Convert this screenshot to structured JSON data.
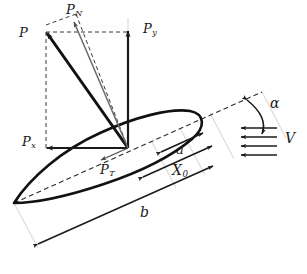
{
  "figure": {
    "type": "airfoil-force-diagram"
  },
  "labels": {
    "resultant_force": {
      "base": "P",
      "sub": "",
      "x": 19,
      "y": 26
    },
    "normal_force": {
      "base": "P",
      "sub": "N",
      "x": 66,
      "y": 3
    },
    "vertical_force": {
      "base": "P",
      "sub": "y",
      "x": 143,
      "y": 22
    },
    "horizontal_force": {
      "base": "P",
      "sub": "x",
      "x": 22,
      "y": 135
    },
    "tangential_force": {
      "base": "P",
      "sub": "T",
      "x": 100,
      "y": 163
    },
    "angle_of_attack": {
      "base": "α",
      "sub": "",
      "x": 270,
      "y": 96
    },
    "velocity": {
      "base": "V",
      "sub": "",
      "x": 285,
      "y": 131
    },
    "dim_a": {
      "base": "a",
      "sub": "",
      "x": 176,
      "y": 143
    },
    "dim_x0": {
      "base": "X",
      "sub": "0",
      "x": 172,
      "y": 163
    },
    "dim_b": {
      "base": "b",
      "sub": "",
      "x": 140,
      "y": 205
    }
  },
  "colors": {
    "stroke": "#1a1a1a",
    "thin_stroke": "#5a5a5a",
    "extension_line": "#d8d8d8",
    "background": "#ffffff"
  },
  "geometry": {
    "force_origin": {
      "x": 128,
      "y": 148
    },
    "p_tip": {
      "x": 45,
      "y": 32
    },
    "pn_tip": {
      "x": 72,
      "y": 20
    },
    "py_tip": {
      "x": 128,
      "y": 30
    },
    "px_tip": {
      "x": 46,
      "y": 148
    },
    "chord_line": {
      "x1": 14,
      "y1": 203,
      "x2": 262,
      "y2": 92
    },
    "leading_edge": {
      "x": 14,
      "y": 203
    },
    "flow_arrow_count": 4
  }
}
